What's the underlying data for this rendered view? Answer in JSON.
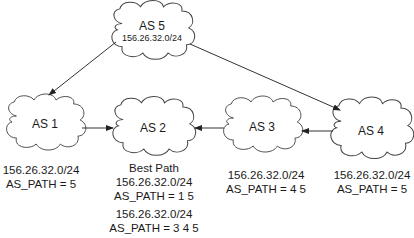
{
  "nodes": [
    {
      "id": "as5",
      "label": "AS 5",
      "prefix": "156.26.32.0/24"
    },
    {
      "id": "as1",
      "label": "AS 1"
    },
    {
      "id": "as2",
      "label": "AS 2"
    },
    {
      "id": "as3",
      "label": "AS 3"
    },
    {
      "id": "as4",
      "label": "AS 4"
    }
  ],
  "edges": [
    {
      "from": "AS 5",
      "to": "AS 1"
    },
    {
      "from": "AS 5",
      "to": "AS 4"
    },
    {
      "from": "AS 1",
      "to": "AS 2"
    },
    {
      "from": "AS 3",
      "to": "AS 2"
    },
    {
      "from": "AS 4",
      "to": "AS 3"
    }
  ],
  "annotations": {
    "as1": {
      "prefix": "156.26.32.0/24",
      "as_path": "AS_PATH = 5"
    },
    "as2": {
      "best_path_label": "Best Path",
      "best": {
        "prefix": "156.26.32.0/24",
        "as_path": "AS_PATH = 1 5"
      },
      "alt": {
        "prefix": "156.26.32.0/24",
        "as_path": "AS_PATH = 3 4 5"
      }
    },
    "as3": {
      "prefix": "156.26.32.0/24",
      "as_path": "AS_PATH = 4 5"
    },
    "as4": {
      "prefix": "156.26.32.0/24",
      "as_path": "AS_PATH = 5"
    }
  }
}
